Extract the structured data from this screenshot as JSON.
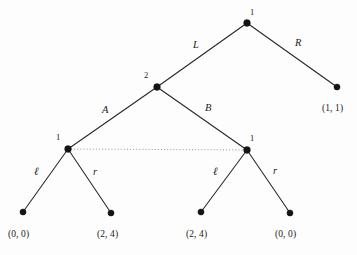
{
  "figure": {
    "type": "extensive-form-game-tree",
    "background_color": "#fdfdfd",
    "line_color": "#262626",
    "node_color": "#141414",
    "infoset_color": "#8a8a8a",
    "width": 357,
    "height": 255
  },
  "nodes": [
    {
      "id": "root",
      "owner_label": "1",
      "x": 247,
      "y": 23,
      "kind": "decision",
      "label_x": 250,
      "label_y": 8,
      "label_anchor": "above-right"
    },
    {
      "id": "n2",
      "owner_label": "2",
      "x": 157,
      "y": 87,
      "kind": "decision",
      "label_x": 144,
      "label_y": 71,
      "label_anchor": "above-left"
    },
    {
      "id": "n1L",
      "owner_label": "1",
      "x": 68,
      "y": 149,
      "kind": "decision",
      "label_x": 56,
      "label_y": 133,
      "label_anchor": "above-left"
    },
    {
      "id": "n1R",
      "owner_label": "1",
      "x": 247,
      "y": 150,
      "kind": "decision",
      "label_x": 250,
      "label_y": 134,
      "label_anchor": "above-right"
    },
    {
      "id": "tR",
      "owner_label": "",
      "x": 337,
      "y": 87,
      "kind": "terminal",
      "label_x": 0,
      "label_y": 0,
      "label_anchor": ""
    },
    {
      "id": "tLl",
      "owner_label": "",
      "x": 23,
      "y": 212,
      "kind": "terminal",
      "label_x": 0,
      "label_y": 0,
      "label_anchor": ""
    },
    {
      "id": "tLr",
      "owner_label": "",
      "x": 111,
      "y": 213,
      "kind": "terminal",
      "label_x": 0,
      "label_y": 0,
      "label_anchor": ""
    },
    {
      "id": "tRl",
      "owner_label": "",
      "x": 201,
      "y": 212,
      "kind": "terminal",
      "label_x": 0,
      "label_y": 0,
      "label_anchor": ""
    },
    {
      "id": "tRr",
      "owner_label": "",
      "x": 290,
      "y": 213,
      "kind": "terminal",
      "label_x": 0,
      "label_y": 0,
      "label_anchor": ""
    }
  ],
  "edges": [
    {
      "id": "e-root-L",
      "from": "root",
      "to": "n2",
      "x1": 247,
      "y1": 23,
      "x2": 157,
      "y2": 87,
      "action": "L",
      "label_x": 193,
      "label_y": 40
    },
    {
      "id": "e-root-R",
      "from": "root",
      "to": "tR",
      "x1": 247,
      "y1": 23,
      "x2": 337,
      "y2": 87,
      "action": "R",
      "label_x": 295,
      "label_y": 38
    },
    {
      "id": "e-n2-A",
      "from": "n2",
      "to": "n1L",
      "x1": 157,
      "y1": 87,
      "x2": 68,
      "y2": 149,
      "action": "A",
      "label_x": 102,
      "label_y": 105
    },
    {
      "id": "e-n2-B",
      "from": "n2",
      "to": "n1R",
      "x1": 157,
      "y1": 87,
      "x2": 247,
      "y2": 150,
      "action": "B",
      "label_x": 205,
      "label_y": 103
    },
    {
      "id": "e-n1L-l",
      "from": "n1L",
      "to": "tLl",
      "x1": 68,
      "y1": 149,
      "x2": 23,
      "y2": 212,
      "action": "ℓ",
      "label_x": 34,
      "label_y": 166
    },
    {
      "id": "e-n1L-r",
      "from": "n1L",
      "to": "tLr",
      "x1": 68,
      "y1": 149,
      "x2": 111,
      "y2": 213,
      "action": "r",
      "label_x": 93,
      "label_y": 167
    },
    {
      "id": "e-n1R-l",
      "from": "n1R",
      "to": "tRl",
      "x1": 247,
      "y1": 150,
      "x2": 201,
      "y2": 212,
      "action": "ℓ",
      "label_x": 213,
      "label_y": 166
    },
    {
      "id": "e-n1R-r",
      "from": "n1R",
      "to": "tRr",
      "x1": 247,
      "y1": 150,
      "x2": 290,
      "y2": 213,
      "action": "r",
      "label_x": 273,
      "label_y": 166
    }
  ],
  "information_set": {
    "id": "infoset-player1",
    "connects": [
      "n1L",
      "n1R"
    ],
    "x1": 68,
    "y1": 149,
    "x2": 247,
    "y2": 150,
    "style": "dotted"
  },
  "payoffs": [
    {
      "id": "payoff-R",
      "node": "tR",
      "text": "(1, 1)",
      "x": 322,
      "y": 104
    },
    {
      "id": "payoff-Ll",
      "node": "tLl",
      "text": "(0, 0)",
      "x": 8,
      "y": 230
    },
    {
      "id": "payoff-Lr",
      "node": "tLr",
      "text": "(2, 4)",
      "x": 97,
      "y": 230
    },
    {
      "id": "payoff-Rl",
      "node": "tRl",
      "text": "(2, 4)",
      "x": 186,
      "y": 230
    },
    {
      "id": "payoff-Rr",
      "node": "tRr",
      "text": "(0, 0)",
      "x": 275,
      "y": 230
    }
  ]
}
